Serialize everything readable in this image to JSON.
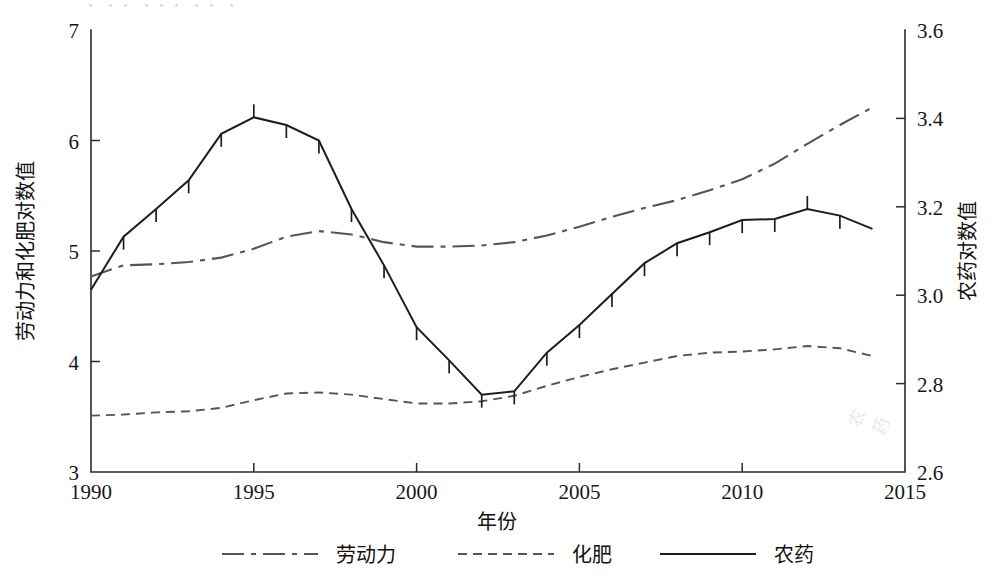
{
  "figure": {
    "ghost_top_text": "・ ・・ ・・・ ・・ ・",
    "smudge_text": "农药"
  },
  "chart_data": {
    "type": "line",
    "title": "",
    "xlabel": "年份",
    "ylabel": "劳动力和化肥对数值",
    "y2label": "农药对数值",
    "grid": false,
    "legend_position": "bottom",
    "xlim": [
      1990,
      2015
    ],
    "ylim": [
      3,
      7
    ],
    "y2lim": [
      2.6,
      3.6
    ],
    "xticks": [
      1990,
      1995,
      2000,
      2005,
      2010,
      2015
    ],
    "xticklabels": [
      "1990",
      "1995",
      "2000",
      "2005",
      "2010",
      "2015"
    ],
    "yticks": [
      3,
      4,
      5,
      6,
      7
    ],
    "yticklabels": [
      "3",
      "4",
      "5",
      "6",
      "7"
    ],
    "y2ticks": [
      2.6,
      2.8,
      3.0,
      3.2,
      3.4,
      3.6
    ],
    "y2ticklabels": [
      "2.6",
      "2.8",
      "3.0",
      "3.2",
      "3.4",
      "3.6"
    ],
    "x": [
      1990,
      1991,
      1992,
      1993,
      1994,
      1995,
      1996,
      1997,
      1998,
      1999,
      2000,
      2001,
      2002,
      2003,
      2004,
      2005,
      2006,
      2007,
      2008,
      2009,
      2010,
      2011,
      2012,
      2013,
      2014
    ],
    "series": [
      {
        "name": "劳动力",
        "axis": "left",
        "style": "dash-dot",
        "values": [
          4.77,
          4.87,
          4.88,
          4.9,
          4.94,
          5.02,
          5.13,
          5.18,
          5.15,
          5.08,
          5.04,
          5.04,
          5.05,
          5.08,
          5.14,
          5.22,
          5.31,
          5.39,
          5.46,
          5.55,
          5.65,
          5.79,
          5.97,
          6.14,
          6.3
        ]
      },
      {
        "name": "化肥",
        "axis": "left",
        "style": "dotted",
        "values": [
          3.51,
          3.52,
          3.54,
          3.55,
          3.58,
          3.65,
          3.71,
          3.72,
          3.7,
          3.66,
          3.62,
          3.62,
          3.64,
          3.69,
          3.78,
          3.86,
          3.93,
          3.99,
          4.05,
          4.08,
          4.09,
          4.11,
          4.14,
          4.12,
          4.05
        ]
      },
      {
        "name": "农药",
        "axis": "right",
        "style": "solid",
        "values_left_scale": [
          4.45,
          4.93,
          5.18,
          5.44,
          5.86,
          6.01,
          5.94,
          5.8,
          5.18,
          4.67,
          4.11,
          3.81,
          3.5,
          3.53,
          3.88,
          4.13,
          4.41,
          4.69,
          4.87,
          4.97,
          5.08,
          5.09,
          5.18,
          5.12,
          5.0
        ],
        "values": [
          3.0125,
          3.1325,
          3.195,
          3.26,
          3.365,
          3.4025,
          3.385,
          3.35,
          3.195,
          3.0675,
          2.9275,
          2.8525,
          2.775,
          2.7825,
          2.87,
          2.9325,
          3.0025,
          3.0725,
          3.1175,
          3.1425,
          3.17,
          3.1725,
          3.195,
          3.18,
          3.15
        ]
      }
    ],
    "legend": [
      {
        "label": "劳动力",
        "style": "dash-dot"
      },
      {
        "label": "化肥",
        "style": "dotted"
      },
      {
        "label": "农药",
        "style": "solid"
      }
    ]
  }
}
